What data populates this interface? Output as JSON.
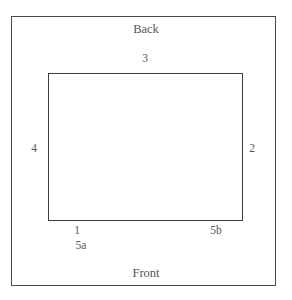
{
  "figure": {
    "type": "schematic-plan-diagram",
    "background_color": "#ffffff",
    "line_color": "#4a4a4a",
    "text_color": "#555555",
    "clipped_top_text": "",
    "orientation_labels": {
      "back": "Back",
      "front": "Front"
    },
    "edge_labels": {
      "top": "3",
      "right": "2",
      "left": "4",
      "bottom_left": "1",
      "bottom_left_alt": "5a",
      "bottom_right": "5b"
    },
    "outer_rect": {
      "x": 11,
      "y": 16,
      "width": 265,
      "height": 270
    },
    "inner_rect": {
      "x": 48,
      "y": 73,
      "width": 195,
      "height": 148
    }
  }
}
